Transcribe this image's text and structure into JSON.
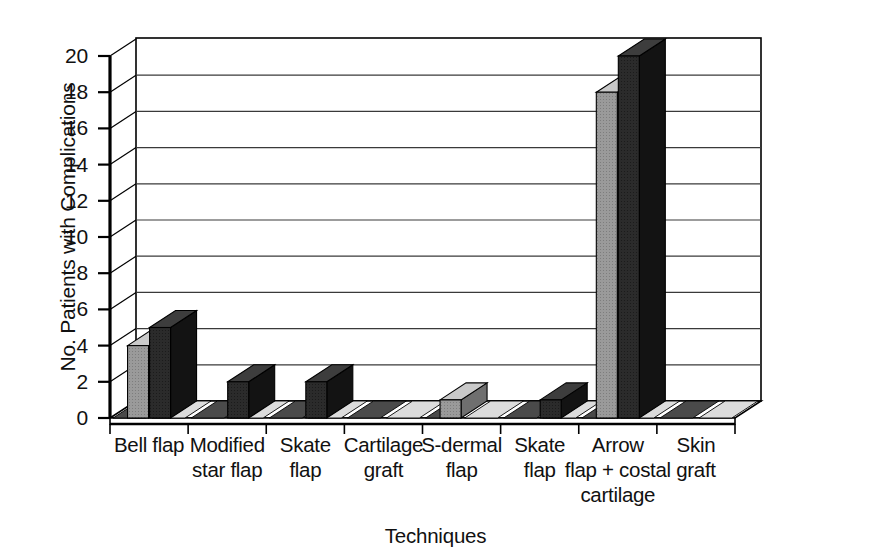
{
  "chart_data": {
    "type": "bar",
    "title": "",
    "subtitle": "",
    "xlabel": "Techniques",
    "ylabel": "No. Patients with Complications",
    "categories": [
      "Bell flap",
      "Modified star flap",
      "Skate flap",
      "Cartilage graft",
      "S-dermal flap",
      "Skate flap",
      "Arrow flap + costal cartilage",
      "Skin graft"
    ],
    "category_lines": [
      [
        "Bell flap"
      ],
      [
        "Modified",
        "star flap"
      ],
      [
        "Skate",
        "flap"
      ],
      [
        "Cartilage",
        "graft"
      ],
      [
        "S-dermal",
        "flap"
      ],
      [
        "Skate",
        "flap"
      ],
      [
        "Arrow",
        "flap + costal",
        "cartilage"
      ],
      [
        "Skin",
        "graft"
      ]
    ],
    "series": [
      {
        "name": "Series 1",
        "color": "#8f8f8f",
        "values": [
          4,
          0,
          0,
          0,
          1,
          0,
          18,
          0
        ]
      },
      {
        "name": "Series 2",
        "color": "#2a2a2a",
        "values": [
          5,
          2,
          2,
          0,
          0,
          1,
          20,
          0
        ]
      }
    ],
    "ylim": [
      0,
      20
    ],
    "yticks": [
      0,
      2,
      4,
      6,
      8,
      10,
      12,
      14,
      16,
      18,
      20
    ],
    "ytick_labels": [
      "0",
      "2",
      "4",
      "6",
      "8",
      "10",
      "12",
      "14",
      "16",
      "18",
      "20"
    ],
    "grid": true,
    "grid_axis": "y",
    "legend": "none",
    "style": "3d-column",
    "colors": {
      "axis": "#000000",
      "grid": "#3a3a3a",
      "plot_background": "#ffffff",
      "series_light": "#8f8f8f",
      "series_dark": "#2a2a2a",
      "floor_light": "#dcdcdc",
      "floor_dark": "#4a4a4a"
    }
  },
  "figure": {
    "yaxis_title": "No. Patients with Complications",
    "xaxis_title": "Techniques"
  }
}
